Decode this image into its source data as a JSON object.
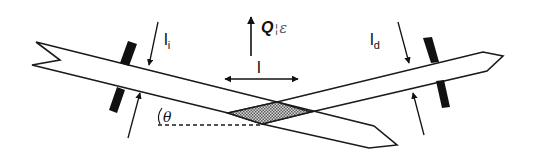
{
  "diagram": {
    "type": "reflection-geometry",
    "labels": {
      "incident_width": "l",
      "incident_subscript": "i",
      "diffracted_width": "l",
      "diffracted_subscript": "d",
      "q_vector": "Q",
      "q_separator": "¦",
      "q_parallel": "ε",
      "footprint_length": "l",
      "angle": "θ"
    },
    "elements": {
      "incident_beam": "Incoming beam (left, travelling down-right)",
      "diffracted_beam": "Outgoing beam (right, travelling up-right)",
      "incident_slit": "Slit pair on incident side",
      "diffracted_slit": "Slit pair on diffracted side",
      "footprint": "Shaded diamond-shaped illuminated volume",
      "reference_line": "Dashed horizontal reference line for angle θ"
    },
    "colors": {
      "stroke": "#1a1a1a",
      "footprint_fill": "#a8a8a8",
      "background": "#ffffff"
    }
  }
}
